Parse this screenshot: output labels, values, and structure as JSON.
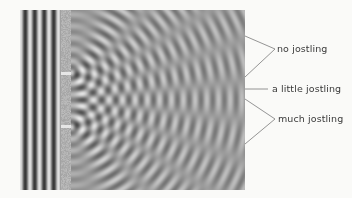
{
  "figure": {
    "type": "double-slit interference diagram",
    "plane_waves": {
      "count": 4,
      "region": "left of barrier"
    },
    "barrier": {
      "slits": 2
    },
    "annotations": [
      {
        "id": "no-jostling",
        "label": "no jostling"
      },
      {
        "id": "a-little-jostling",
        "label": "a little jostling"
      },
      {
        "id": "much-jostling",
        "label": "much jostling"
      }
    ]
  },
  "colors": {
    "background": "#fafaf8",
    "line": "#7a7a7a",
    "text": "#3a3a3a"
  }
}
